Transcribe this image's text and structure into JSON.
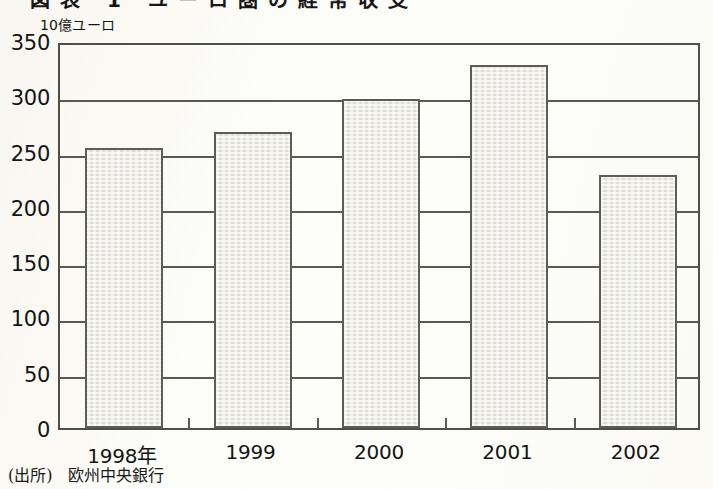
{
  "figure": {
    "title_partial": "図表 1  ユーロ圏の経常収支",
    "unit_label": "10億ユーロ",
    "source_label": "(出所)",
    "source_value": "欧州中央銀行"
  },
  "colors": {
    "bar_fill": "#e9e8de",
    "bar_border": "#5c5e55",
    "axis": "#4d4f48",
    "text": "#141414",
    "paper": "#fdfdfa"
  },
  "chart_data": {
    "type": "bar",
    "title": "図表 1  ユーロ圏の経常収支",
    "xlabel": "",
    "ylabel": "10億ユーロ",
    "categories": [
      "1998年",
      "1999",
      "2000",
      "2001",
      "2002"
    ],
    "values": [
      253,
      268,
      298,
      328,
      229
    ],
    "ylim": [
      0,
      350
    ],
    "yticks": [
      0,
      50,
      100,
      150,
      200,
      250,
      300,
      350
    ],
    "ytick_labels": [
      "0",
      "50",
      "100",
      "150",
      "200",
      "250",
      "300",
      "350"
    ],
    "grid": true,
    "grid_axis": "y",
    "legend": false,
    "series": [
      {
        "name": "10億ユーロ",
        "values": [
          253,
          268,
          298,
          328,
          229
        ]
      }
    ],
    "annotations": [],
    "source": "欧州中央銀行"
  }
}
